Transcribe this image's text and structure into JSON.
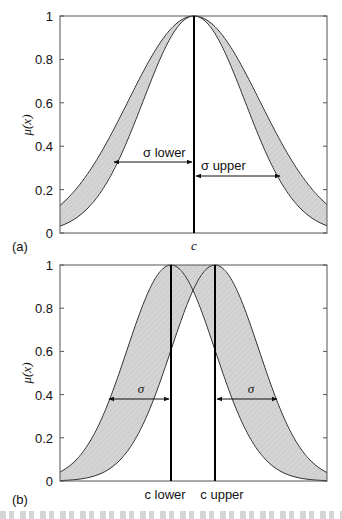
{
  "chart_data": [
    {
      "panel": "(a)",
      "type": "area",
      "title": "",
      "xlabel": "",
      "ylabel": "μ(x)",
      "ylim": [
        0,
        1
      ],
      "yticks": [
        "0",
        "0.2",
        "0.4",
        "0.6",
        "0.8",
        "1"
      ],
      "xtick_labels": [
        "c"
      ],
      "grid": false,
      "description": "Interval type-2 Gaussian membership function with uncertain standard deviation (fixed mean c); shaded footprint of uncertainty between lower and upper Gaussians",
      "series": [
        {
          "name": "upper MF",
          "mean": "c",
          "sigma": "σ upper",
          "value_at_edges": 0.13,
          "value_at_0.4_halfwidth": 0.27
        },
        {
          "name": "lower MF",
          "mean": "c",
          "sigma": "σ lower",
          "value_at_edges": 0.01,
          "value_at_0.4_halfwidth": 0.21
        }
      ],
      "annotations": [
        "σ lower",
        "σ upper",
        "c"
      ]
    },
    {
      "panel": "(b)",
      "type": "area",
      "title": "",
      "xlabel": "",
      "ylabel": "μ(x)",
      "ylim": [
        0,
        1
      ],
      "yticks": [
        "0",
        "0.2",
        "0.4",
        "0.6",
        "0.8",
        "1"
      ],
      "xtick_labels": [
        "c lower",
        "c upper"
      ],
      "grid": false,
      "description": "Interval type-2 Gaussian membership function with uncertain mean (fixed σ); shaded footprint of uncertainty between two Gaussians centred at c lower and c upper, top flattened at 1 between them",
      "series": [
        {
          "name": "Gaussian at c lower",
          "mean": "c lower",
          "sigma": "σ"
        },
        {
          "name": "Gaussian at c upper",
          "mean": "c upper",
          "sigma": "σ"
        }
      ],
      "crossing_value": 0.88,
      "lower_mf_value_at_centres": 0.6,
      "annotations": [
        "σ",
        "σ",
        "c lower",
        "c upper"
      ]
    }
  ],
  "panels": {
    "a": {
      "label": "(a)",
      "ylabel": "μ(x)",
      "yticks": [
        "0",
        "0.2",
        "0.4",
        "0.6",
        "0.8",
        "1"
      ],
      "xlabel_center": "c",
      "sigma_lower": "σ lower",
      "sigma_upper": "σ upper"
    },
    "b": {
      "label": "(b)",
      "ylabel": "μ(x)",
      "yticks": [
        "0",
        "0.2",
        "0.4",
        "0.6",
        "0.8",
        "1"
      ],
      "x_c_lower": "c lower",
      "x_c_upper": "c upper",
      "sigma_left": "σ",
      "sigma_right": "σ"
    }
  },
  "colors": {
    "fou_fill": "#d2d2d2",
    "curve": "#333333",
    "axis": "#555555",
    "center_line": "#000000"
  }
}
